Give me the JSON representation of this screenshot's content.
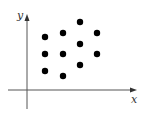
{
  "chart_data": {
    "type": "scatter",
    "title": "",
    "xlabel": "x",
    "ylabel": "y",
    "grid": false,
    "legend": null,
    "ticks": false,
    "points": [
      {
        "x": 1,
        "y": 5
      },
      {
        "x": 2,
        "y": 5.3
      },
      {
        "x": 3,
        "y": 6.2
      },
      {
        "x": 4,
        "y": 5.3
      },
      {
        "x": 3,
        "y": 4.6
      },
      {
        "x": 1,
        "y": 4
      },
      {
        "x": 2,
        "y": 4
      },
      {
        "x": 4,
        "y": 4
      },
      {
        "x": 3,
        "y": 3.4
      },
      {
        "x": 1,
        "y": 3.1
      },
      {
        "x": 2,
        "y": 2.8
      }
    ],
    "pixel_points": [
      [
        45,
        37
      ],
      [
        63,
        33
      ],
      [
        80,
        22
      ],
      [
        97,
        33
      ],
      [
        80,
        44
      ],
      [
        45,
        54
      ],
      [
        63,
        54
      ],
      [
        97,
        54
      ],
      [
        80,
        65
      ],
      [
        45,
        71
      ],
      [
        63,
        76
      ]
    ],
    "colors": {
      "axis": "#555555",
      "point": "#000000",
      "label": "#333333"
    }
  }
}
